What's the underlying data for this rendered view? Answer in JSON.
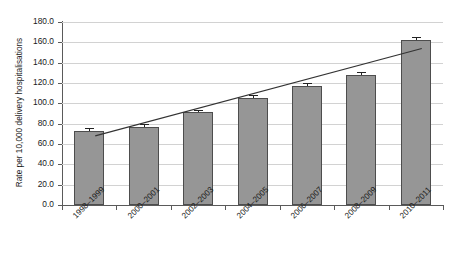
{
  "chart_data": {
    "type": "bar",
    "title": "",
    "subtitle": "",
    "xlabel": "",
    "ylabel": "Rate per 10,000 delivery hospitalisations",
    "categories": [
      "1998–1999",
      "2000–2001",
      "2002–2003",
      "2004–2005",
      "2006–2007",
      "2008–2009",
      "2010–2011"
    ],
    "values": [
      73.0,
      77.0,
      91.0,
      105.5,
      117.0,
      128.0,
      162.0
    ],
    "errors": [
      2.5,
      2.2,
      2.4,
      2.6,
      2.8,
      2.9,
      3.2
    ],
    "ylim": [
      0.0,
      180.0
    ],
    "ytick_step": 20.0,
    "yticks": [
      "0.0",
      "20.0",
      "40.0",
      "60.0",
      "80.0",
      "100.0",
      "120.0",
      "140.0",
      "160.0",
      "180.0"
    ],
    "ytick_values": [
      0,
      20,
      40,
      60,
      80,
      100,
      120,
      140,
      160,
      180
    ],
    "grid": true,
    "legend": false,
    "legend_position": "none",
    "series": [
      {
        "name": "Rate per 10,000 delivery hospitalisations",
        "values": [
          73.0,
          77.0,
          91.0,
          105.5,
          117.0,
          128.0,
          162.0
        ]
      },
      {
        "name": "Linear trend",
        "type": "line",
        "x_start": "1998–1999",
        "x_end": "2010–2011",
        "y_start": 68.0,
        "y_end": 154.0
      }
    ],
    "annotations": [],
    "colors": {
      "bar_fill": "#969696",
      "bar_edge": "#4d4d4d",
      "gridline": "#d2d2d2",
      "axis": "#5a5a5a",
      "trendline": "#333333",
      "error_bar": "#222222",
      "text": "#1a1a1a",
      "background": "#ffffff"
    }
  }
}
